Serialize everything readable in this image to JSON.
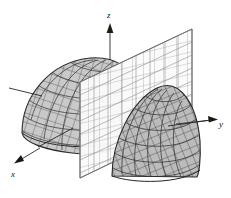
{
  "figure": {
    "kind": "3d-surface-plot",
    "background_color": "#ffffff",
    "width": 231,
    "height": 198
  },
  "axes": {
    "z": {
      "label": "z",
      "name": "z-axis",
      "direction": "up",
      "arrow": true
    },
    "y": {
      "label": "y",
      "name": "y-axis",
      "direction": "right",
      "arrow": true
    },
    "x": {
      "label": "x",
      "name": "x-axis",
      "direction": "down-left",
      "arrow": true
    }
  },
  "surfaces": [
    {
      "name": "dome-left-half",
      "description": "left portion of the dome surface behind the cutting plane",
      "fill_color": "#c9c9c9",
      "mesh_color": "#4a4a4a",
      "mesh_style": "cross-hatched grid"
    },
    {
      "name": "dome-right-half",
      "description": "right portion of the dome surface in front of the cutting plane",
      "fill_color": "#b9b9b9",
      "mesh_color": "#3d3d3d",
      "mesh_style": "cross-hatched grid"
    }
  ],
  "plane": {
    "name": "cutting-plane",
    "description": "vertical grid plane slicing the dome",
    "fill_color": "#fbfbfb",
    "grid_color": "#8d8d8d",
    "edge_color": "#6f6f6f"
  },
  "leaders": [
    {
      "name": "leader-line-outer-left",
      "description": "pointer to outer dome shell at left"
    },
    {
      "name": "leader-line-inner-cut",
      "description": "pointer to cut interior of left dome"
    },
    {
      "name": "leader-line-right-dome",
      "description": "pointer to right dome surface"
    }
  ],
  "colors": {
    "ink": "#141414",
    "mesh_dark": "#3d3d3d",
    "surface_light": "#c9c9c9",
    "surface_mid": "#b9b9b9",
    "plane_white": "#fbfbfb",
    "plane_grid": "#8d8d8d"
  }
}
